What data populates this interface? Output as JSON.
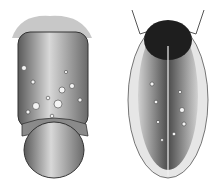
{
  "image": {
    "description": "Grayscale engraved medical illustration, two anatomical panels side by side depicting skin lesions",
    "style": "pen-and-ink engraving, grayscale",
    "panels": [
      {
        "id": "left",
        "subject": "anatomical illustration with raised lesions"
      },
      {
        "id": "right",
        "subject": "anatomical illustration with raised lesions"
      }
    ],
    "colors": {
      "background": "#ffffff",
      "ink_dark": "#1a1a1a",
      "ink_mid": "#6e6e6e",
      "ink_light": "#bdbdbd",
      "highlight": "#f2f2f2"
    }
  }
}
